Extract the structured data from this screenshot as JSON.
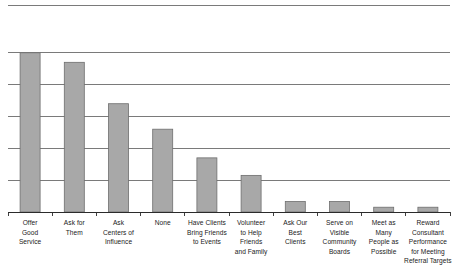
{
  "chart_data": {
    "type": "bar",
    "title": "",
    "subtitle": "",
    "xlabel": "",
    "ylabel": "",
    "legend": [],
    "legend_position": "none",
    "grid": true,
    "grid_orientation": "horizontal",
    "gridline_count": 6,
    "axis_ranges": {
      "ylim": [
        0,
        6.5
      ],
      "y_gridline_values": [
        0,
        1,
        2,
        3,
        4,
        5,
        6.5
      ]
    },
    "bar_color": "#a8a8a8",
    "bar_edge_color": "#6e6e6e",
    "axis_color": "#2b2b2b",
    "gridline_color": "#595959",
    "background_color": "#ffffff",
    "categories": [
      "Offer Good Service",
      "Ask for Them",
      "Ask Centers of Influence",
      "None",
      "Have Clients Bring Friends to Events",
      "Volunteer to Help Friends and Family",
      "Ask Our Best Clients",
      "Serve on Visible Community Boards",
      "Meet as Many People as Possible",
      "Reward Consultant Performance for Meeting Referral Targets"
    ],
    "category_label_lines": [
      [
        "Offer",
        "Good",
        "Service"
      ],
      [
        "Ask for",
        "Them"
      ],
      [
        "Ask",
        "Centers of",
        "Influence"
      ],
      [
        "None"
      ],
      [
        "Have Clients",
        "Bring Friends",
        "to Events"
      ],
      [
        "Volunteer",
        "to Help",
        "Friends",
        "and Family"
      ],
      [
        "Ask Our",
        "Best",
        "Clients"
      ],
      [
        "Serve on",
        "Visible",
        "Community",
        "Boards"
      ],
      [
        "Meet as",
        "Many",
        "People as",
        "Possible"
      ],
      [
        "Reward",
        "Consultant",
        "Performance",
        "for Meeting",
        "Referral Targets"
      ]
    ],
    "values": [
      5.0,
      4.7,
      3.4,
      2.6,
      1.7,
      1.15,
      0.33,
      0.33,
      0.15,
      0.15
    ]
  }
}
